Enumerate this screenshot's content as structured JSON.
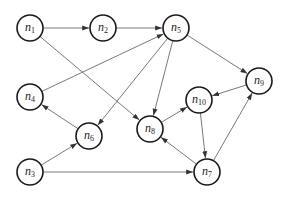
{
  "diagram": {
    "type": "directed-graph",
    "node_radius": 13,
    "colors": {
      "node_stroke": "#1a1a1a",
      "edge": "#555555",
      "background": "#ffffff"
    },
    "nodes": [
      {
        "id": "n1",
        "base": "n",
        "sub": "1",
        "x": 30,
        "y": 28
      },
      {
        "id": "n2",
        "base": "n",
        "sub": "2",
        "x": 103,
        "y": 28
      },
      {
        "id": "n5",
        "base": "n",
        "sub": "5",
        "x": 176,
        "y": 28
      },
      {
        "id": "n9",
        "base": "n",
        "sub": "9",
        "x": 259,
        "y": 81
      },
      {
        "id": "n4",
        "base": "n",
        "sub": "4",
        "x": 30,
        "y": 97
      },
      {
        "id": "n10",
        "base": "n",
        "sub": "10",
        "x": 199,
        "y": 100
      },
      {
        "id": "n6",
        "base": "n",
        "sub": "6",
        "x": 89,
        "y": 136
      },
      {
        "id": "n8",
        "base": "n",
        "sub": "8",
        "x": 150,
        "y": 129
      },
      {
        "id": "n3",
        "base": "n",
        "sub": "3",
        "x": 30,
        "y": 172
      },
      {
        "id": "n7",
        "base": "n",
        "sub": "7",
        "x": 207,
        "y": 172
      }
    ],
    "edges": [
      {
        "from": "n1",
        "to": "n2"
      },
      {
        "from": "n2",
        "to": "n5"
      },
      {
        "from": "n1",
        "to": "n8"
      },
      {
        "from": "n4",
        "to": "n5"
      },
      {
        "from": "n5",
        "to": "n9"
      },
      {
        "from": "n5",
        "to": "n6"
      },
      {
        "from": "n5",
        "to": "n8"
      },
      {
        "from": "n6",
        "to": "n4"
      },
      {
        "from": "n3",
        "to": "n6"
      },
      {
        "from": "n3",
        "to": "n7"
      },
      {
        "from": "n9",
        "to": "n10"
      },
      {
        "from": "n8",
        "to": "n10"
      },
      {
        "from": "n10",
        "to": "n7"
      },
      {
        "from": "n7",
        "to": "n8"
      },
      {
        "from": "n7",
        "to": "n9"
      }
    ]
  }
}
